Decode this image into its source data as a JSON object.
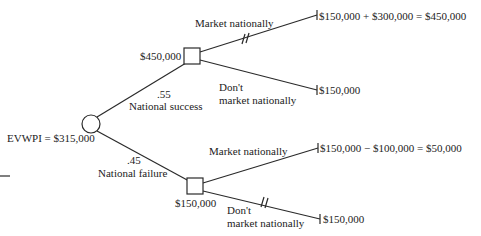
{
  "diagram": {
    "type": "decision-tree",
    "root": {
      "kind": "chance-node",
      "label": "EVWPI = $315,000"
    },
    "branches": [
      {
        "probability": ".55",
        "label": "National success",
        "decision_node_value": "$450,000",
        "options": [
          {
            "label": "Market nationally",
            "payoff": "$150,000 + $300,000 = $450,000",
            "chosen": true
          },
          {
            "label_line1": "Don't",
            "label_line2": "market nationally",
            "payoff": "$150,000",
            "pruned": true
          }
        ]
      },
      {
        "probability": ".45",
        "label": "National failure",
        "decision_node_value": "$150,000",
        "options": [
          {
            "label": "Market nationally",
            "payoff": "$150,000 − $100,000 = $50,000",
            "pruned": true
          },
          {
            "label_line1": "Don't",
            "label_line2": "market nationally",
            "payoff": "$150,000",
            "chosen": true
          }
        ]
      }
    ]
  },
  "colors": {
    "line": "#2a2a2a",
    "text": "#222222",
    "background": "#ffffff"
  }
}
